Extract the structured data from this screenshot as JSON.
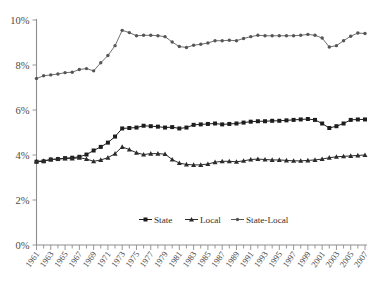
{
  "chart_data": {
    "type": "line",
    "title": "",
    "subtitle": "",
    "xlabel": "",
    "ylabel": "",
    "grid": false,
    "legend_position": "bottom",
    "ylim": [
      0,
      10
    ],
    "ytick_labels": [
      "0%",
      "2%",
      "4%",
      "6%",
      "8%",
      "10%"
    ],
    "ytick_values": [
      0,
      2,
      4,
      6,
      8,
      10
    ],
    "xlim": [
      1961,
      2007
    ],
    "x": [
      1961,
      1962,
      1963,
      1964,
      1965,
      1966,
      1967,
      1968,
      1969,
      1970,
      1971,
      1972,
      1973,
      1974,
      1975,
      1976,
      1977,
      1978,
      1979,
      1980,
      1981,
      1982,
      1983,
      1984,
      1985,
      1986,
      1987,
      1988,
      1989,
      1990,
      1991,
      1992,
      1993,
      1994,
      1995,
      1996,
      1997,
      1998,
      1999,
      2000,
      2001,
      2002,
      2003,
      2004,
      2005,
      2006,
      2007
    ],
    "xtick_labels": [
      "1961",
      "1963",
      "1965",
      "1967",
      "1969",
      "1971",
      "1973",
      "1975",
      "1977",
      "1979",
      "1981",
      "1983",
      "1985",
      "1987",
      "1989",
      "1991",
      "1993",
      "1995",
      "1997",
      "1999",
      "2001",
      "2003",
      "2005",
      "2007"
    ],
    "series": [
      {
        "name": "State",
        "marker": "square",
        "color": "#1d1d1d",
        "values": [
          3.7,
          3.72,
          3.8,
          3.82,
          3.86,
          3.88,
          3.92,
          4.02,
          4.2,
          4.36,
          4.55,
          4.82,
          5.18,
          5.2,
          5.22,
          5.3,
          5.28,
          5.26,
          5.22,
          5.24,
          5.18,
          5.22,
          5.34,
          5.36,
          5.38,
          5.4,
          5.36,
          5.38,
          5.4,
          5.44,
          5.48,
          5.5,
          5.5,
          5.52,
          5.52,
          5.54,
          5.56,
          5.58,
          5.6,
          5.56,
          5.4,
          5.2,
          5.28,
          5.4,
          5.56,
          5.58,
          5.58
        ]
      },
      {
        "name": "Local",
        "marker": "triangle",
        "color": "#2b2b2b",
        "values": [
          3.72,
          3.74,
          3.8,
          3.82,
          3.84,
          3.84,
          3.88,
          3.82,
          3.72,
          3.78,
          3.88,
          4.06,
          4.36,
          4.24,
          4.1,
          4.02,
          4.06,
          4.06,
          4.04,
          3.8,
          3.64,
          3.58,
          3.56,
          3.56,
          3.6,
          3.68,
          3.72,
          3.72,
          3.7,
          3.74,
          3.8,
          3.82,
          3.8,
          3.78,
          3.78,
          3.76,
          3.74,
          3.74,
          3.76,
          3.78,
          3.82,
          3.88,
          3.92,
          3.94,
          3.96,
          3.98,
          4.0
        ]
      },
      {
        "name": "State-Local",
        "marker": "dot",
        "color": "#555555",
        "values": [
          7.4,
          7.52,
          7.56,
          7.6,
          7.66,
          7.68,
          7.8,
          7.84,
          7.74,
          8.1,
          8.42,
          8.86,
          9.54,
          9.44,
          9.3,
          9.32,
          9.32,
          9.3,
          9.26,
          9.02,
          8.82,
          8.78,
          8.88,
          8.92,
          8.98,
          9.08,
          9.08,
          9.1,
          9.08,
          9.18,
          9.26,
          9.32,
          9.3,
          9.3,
          9.3,
          9.3,
          9.3,
          9.32,
          9.36,
          9.32,
          9.2,
          8.8,
          8.86,
          9.08,
          9.28,
          9.42,
          9.4
        ]
      }
    ]
  },
  "legend": {
    "items": [
      {
        "label": "State",
        "marker": "square"
      },
      {
        "label": "Local",
        "marker": "triangle"
      },
      {
        "label": "State-Local",
        "marker": "dot"
      }
    ]
  }
}
